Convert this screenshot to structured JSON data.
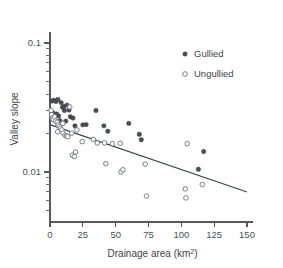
{
  "chart_data": {
    "type": "scatter",
    "title": "",
    "xlabel": "Drainage area (km²)",
    "ylabel": "Valley slope",
    "xlim": [
      0,
      150
    ],
    "ylim": [
      0.004,
      0.13
    ],
    "yscale": "log",
    "xscale": "linear",
    "grid": false,
    "xticks": [
      0,
      25,
      50,
      75,
      100,
      125,
      150
    ],
    "xticklabels": [
      "0",
      "25",
      "50",
      "75",
      "100",
      "125",
      "150"
    ],
    "yticks": [
      0.1,
      0.01
    ],
    "yticklabels": [
      "0.1",
      "0.01"
    ],
    "yminorticks": [
      0.09,
      0.08,
      0.07,
      0.06,
      0.05,
      0.04,
      0.03,
      0.02,
      0.009,
      0.008,
      0.007,
      0.006,
      0.005
    ],
    "legend": {
      "position": "upper-right",
      "entries": [
        {
          "name": "Gullied",
          "marker": "filled-circle",
          "color": "#4a4f54"
        },
        {
          "name": "Ungullied",
          "marker": "open-circle",
          "color": "#6c7277"
        }
      ]
    },
    "series": [
      {
        "name": "Gullied",
        "marker": "filled-circle",
        "color": "#4a4f54",
        "points": [
          [
            1.5,
            0.0355
          ],
          [
            3.0,
            0.036
          ],
          [
            4.5,
            0.0352
          ],
          [
            6.0,
            0.0365
          ],
          [
            8.5,
            0.0345
          ],
          [
            9.5,
            0.0318
          ],
          [
            10.5,
            0.0322
          ],
          [
            11.0,
            0.03
          ],
          [
            13.0,
            0.033
          ],
          [
            14.5,
            0.0302
          ],
          [
            15.5,
            0.0268
          ],
          [
            17.5,
            0.0262
          ],
          [
            6.5,
            0.0272
          ],
          [
            7.5,
            0.025
          ],
          [
            12.0,
            0.0248
          ],
          [
            19.0,
            0.0228
          ],
          [
            25.0,
            0.0232
          ],
          [
            27.5,
            0.0233
          ],
          [
            35.0,
            0.03
          ],
          [
            41.0,
            0.0228
          ],
          [
            44.0,
            0.0207
          ],
          [
            60.0,
            0.0238
          ],
          [
            68.0,
            0.0196
          ],
          [
            69.5,
            0.0178
          ],
          [
            113.0,
            0.0105
          ],
          [
            117.0,
            0.0144
          ],
          [
            2.0,
            0.029
          ],
          [
            5.0,
            0.0282
          ]
        ]
      },
      {
        "name": "Ungullied",
        "marker": "open-circle",
        "color": "#6c7277",
        "points": [
          [
            0.8,
            0.03
          ],
          [
            1.2,
            0.0278
          ],
          [
            1.8,
            0.0262
          ],
          [
            2.5,
            0.0255
          ],
          [
            3.5,
            0.0268
          ],
          [
            4.2,
            0.0248
          ],
          [
            5.5,
            0.0243
          ],
          [
            6.2,
            0.0232
          ],
          [
            7.0,
            0.0225
          ],
          [
            8.0,
            0.0218
          ],
          [
            9.0,
            0.0212
          ],
          [
            10.0,
            0.02
          ],
          [
            11.5,
            0.0193
          ],
          [
            12.5,
            0.019
          ],
          [
            13.5,
            0.0188
          ],
          [
            15.0,
            0.032
          ],
          [
            16.5,
            0.02
          ],
          [
            17.0,
            0.0135
          ],
          [
            18.5,
            0.0132
          ],
          [
            19.5,
            0.0143
          ],
          [
            20.5,
            0.0212
          ],
          [
            24.5,
            0.0172
          ],
          [
            33.0,
            0.0179
          ],
          [
            36.0,
            0.0168
          ],
          [
            41.5,
            0.0168
          ],
          [
            42.5,
            0.0116
          ],
          [
            47.5,
            0.0166
          ],
          [
            53.5,
            0.0167
          ],
          [
            54.0,
            0.01
          ],
          [
            55.5,
            0.0104
          ],
          [
            72.5,
            0.0115
          ],
          [
            73.5,
            0.0065
          ],
          [
            103.0,
            0.0074
          ],
          [
            103.5,
            0.0063
          ],
          [
            104.5,
            0.0166
          ],
          [
            116.0,
            0.008
          ],
          [
            5.8,
            0.0205
          ],
          [
            9.8,
            0.0238
          ]
        ]
      }
    ],
    "trend_line": {
      "name": "regression-line",
      "color": "#3d4245",
      "x_start": 0,
      "y_start": 0.0233,
      "x_end": 150,
      "y_end": 0.007
    }
  }
}
